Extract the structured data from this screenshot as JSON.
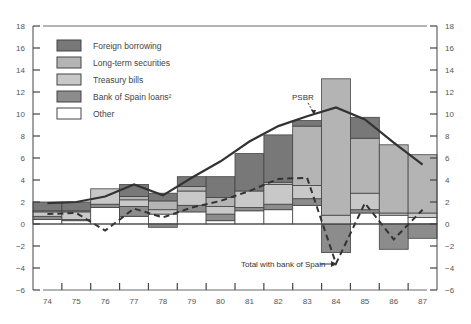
{
  "chart_data": {
    "type": "bar",
    "subtype": "stacked-bar-with-lines",
    "title": "",
    "xlabel": "",
    "ylabel": "",
    "ylim": [
      -6,
      18
    ],
    "yticks": [
      18,
      16,
      14,
      12,
      10,
      8,
      6,
      4,
      2,
      0,
      -2,
      -4,
      -6
    ],
    "ytick_labels": [
      "18",
      "16",
      "14",
      "12",
      "10",
      "8",
      "6",
      "4",
      "2",
      "0",
      "−2",
      "−4",
      "−6"
    ],
    "categories": [
      "74",
      "75",
      "76",
      "77",
      "78",
      "79",
      "80",
      "81",
      "82",
      "83",
      "84",
      "85",
      "86",
      "87"
    ],
    "grid": false,
    "legend_position": "upper-left",
    "series": [
      {
        "name": "Other",
        "color": "#ffffff",
        "values": [
          0.4,
          0.3,
          1.5,
          0.7,
          0.9,
          1.1,
          0.3,
          1.2,
          1.3,
          1.7,
          0.0,
          1.0,
          0.8,
          0.6
        ]
      },
      {
        "name": "Bank of Spain loans²",
        "color": "#8c8c8c",
        "values": [
          0.3,
          0.1,
          0.3,
          0.9,
          -0.3,
          0.6,
          0.6,
          0.3,
          0.5,
          0.6,
          -2.6,
          0.3,
          -2.3,
          -1.3
        ]
      },
      {
        "name": "Treasury bills",
        "color": "#c8c8c8",
        "values": [
          0.4,
          0.7,
          1.4,
          0.6,
          0.4,
          1.3,
          0.7,
          1.5,
          1.8,
          1.2,
          0.8,
          1.5,
          0.2,
          0.4
        ]
      },
      {
        "name": "Long-term securities",
        "color": "#b4b4b4",
        "values": [
          0.1,
          0.1,
          0.0,
          0.3,
          0.8,
          0.4,
          0.8,
          0.0,
          0.2,
          5.4,
          12.4,
          5.0,
          6.2,
          5.3
        ]
      },
      {
        "name": "Foreign borrowing",
        "color": "#787878",
        "values": [
          0.8,
          0.8,
          0.0,
          1.1,
          0.7,
          0.9,
          1.9,
          3.4,
          4.3,
          0.5,
          0.0,
          1.9,
          0.0,
          0.0
        ]
      }
    ],
    "lines": [
      {
        "name": "PSBR",
        "style": "solid",
        "values": [
          1.9,
          2.0,
          2.5,
          3.6,
          2.6,
          4.2,
          5.7,
          7.5,
          8.9,
          9.8,
          10.6,
          9.5,
          7.4,
          5.4
        ]
      },
      {
        "name": "Total with bank of Spain",
        "style": "dashed",
        "values": [
          0.9,
          1.0,
          -0.6,
          1.4,
          0.6,
          1.5,
          2.1,
          3.0,
          4.1,
          4.2,
          -3.6,
          1.9,
          -1.4,
          1.3
        ]
      }
    ],
    "annotations": [
      {
        "text": "PSBR",
        "points_to": "PSBR line near 83"
      },
      {
        "text": "Total with bank of Spain",
        "points_to": "dashed line at 84"
      }
    ]
  },
  "legend": {
    "items": [
      {
        "label": "Foreign borrowing",
        "color": "#787878"
      },
      {
        "label": "Long-term securities",
        "color": "#b4b4b4"
      },
      {
        "label": "Treasury bills",
        "color": "#c8c8c8"
      },
      {
        "label": "Bank of Spain loans²",
        "color": "#8c8c8c"
      },
      {
        "label": "Other",
        "color": "#ffffff"
      }
    ]
  },
  "annotations": {
    "psbr_label": "PSBR",
    "total_label": "Total with bank of Spain"
  }
}
